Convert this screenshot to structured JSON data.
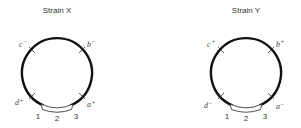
{
  "diagrams": [
    {
      "title": "Strain X",
      "cx": 57,
      "cy": 73,
      "r": 35,
      "markers": {
        "c": {
          "label": "c",
          "sign": "−"
        },
        "b": {
          "label": "b",
          "sign": "−"
        },
        "d": {
          "label": "d",
          "sign": "+"
        },
        "a": {
          "label": "a",
          "sign": "+"
        }
      },
      "segment_labels": [
        "1",
        "2",
        "3"
      ]
    },
    {
      "title": "Strain Y",
      "cx": 246,
      "cy": 73,
      "r": 35,
      "markers": {
        "c": {
          "label": "c",
          "sign": "+"
        },
        "b": {
          "label": "b",
          "sign": "+"
        },
        "d": {
          "label": "d",
          "sign": "−"
        },
        "a": {
          "label": "a",
          "sign": "−"
        }
      },
      "segment_labels": [
        "1",
        "2",
        "3"
      ]
    }
  ],
  "colors": {
    "ring": "#111111",
    "insert_fill": "#ffffff",
    "text": "#333333"
  }
}
